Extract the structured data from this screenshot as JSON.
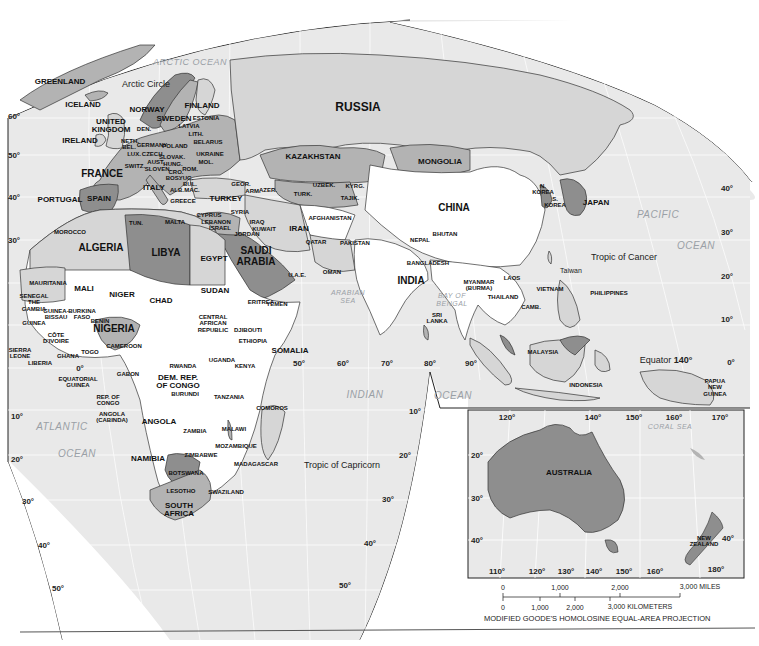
{
  "map": {
    "title": "World map - Eastern Hemisphere",
    "projection_note": "MODIFIED GOODE'S HOMOLOSINE EQUAL-AREA PROJECTION",
    "colors": {
      "ocean": "#e9e9e9",
      "land_light": "#d6d6d6",
      "land_mid": "#b3b3b3",
      "land_dark": "#8e8e8e",
      "land_white": "#ffffff",
      "border": "#333333",
      "graticule": "#ffffff",
      "ocean_label": "#9aa0a6"
    },
    "oceans": {
      "arctic": "ARCTIC OCEAN",
      "atlantic_1": "ATLANTIC",
      "atlantic_2": "OCEAN",
      "indian_1": "INDIAN",
      "indian_2": "OCEAN",
      "pacific_1": "PACIFIC",
      "pacific_2": "OCEAN",
      "arabian_sea": "ARABIAN\nSEA",
      "bay_of_bengal": "BAY OF\nBENGAL",
      "coral_sea": "CORAL SEA"
    },
    "reference_lines": {
      "arctic_circle": "Arctic Circle",
      "tropic_cancer": "Tropic of Cancer",
      "tropic_capricorn": "Tropic of Capricorn",
      "equator": "Equator",
      "equator_lon": "140°"
    },
    "countries": {
      "greenland": "GREENLAND",
      "iceland": "ICELAND",
      "norway": "NORWAY",
      "sweden": "SWEDEN",
      "finland": "FINLAND",
      "estonia": "ESTONIA",
      "latvia": "LATVIA",
      "lith": "LITH.",
      "belarus": "BELARUS",
      "ukraine": "UKRAINE",
      "mol": "MOL.",
      "rom": "ROM.",
      "uk": "UNITED\nKINGDOM",
      "ireland": "IRELAND",
      "den": "DEN.",
      "neth": "NETH.",
      "bel": "BEL.",
      "germany": "GERMANY",
      "poland": "POLAND",
      "lux": "LUX.",
      "czech": "CZECH.",
      "slovak": "SLOVAK.",
      "aust": "AUST.",
      "hung": "HUNG.",
      "switz": "SWITZ.",
      "slov": "SLOVEN.",
      "cro": "CRO.",
      "bos": "BOS.",
      "yug": "YUG.",
      "bul": "BUL.",
      "alb": "ALB.",
      "mac": "MAC.",
      "france": "FRANCE",
      "italy": "ITALY",
      "greece": "GREECE",
      "portugal": "PORTUGAL",
      "spain": "SPAIN",
      "malta": "MALTA",
      "turkey": "TURKEY",
      "cyprus": "CYPRUS",
      "lebanon": "LEBANON",
      "israel": "ISRAEL",
      "syria": "SYRIA",
      "jordan": "JORDAN",
      "iraq": "IRAQ",
      "kuwait": "KUWAIT",
      "georgia": "GEOR.",
      "armenia": "ARM.",
      "azer": "AZER.",
      "russia": "RUSSIA",
      "kazakhstan": "KAZAKHSTAN",
      "mongolia": "MONGOLIA",
      "uzbek": "UZBEK.",
      "turk": "TURK.",
      "kyrg": "KYRG.",
      "tajik": "TAJIK.",
      "afghanistan": "AFGHANISTAN",
      "iran": "IRAN",
      "pakistan": "PAKISTAN",
      "qatar": "QATAR",
      "uae": "U.A.E.",
      "oman": "OMAN",
      "yemen": "YEMEN",
      "saudi": "SAUDI\nARABIA",
      "china": "CHINA",
      "nkorea": "N.\nKOREA",
      "skorea": "S.\nKOREA",
      "japan": "JAPAN",
      "taiwan": "Taiwan",
      "nepal": "NEPAL",
      "bhutan": "BHUTAN",
      "bangladesh": "BANGLADESH",
      "india": "INDIA",
      "srilanka": "SRI\nLANKA",
      "myanmar": "MYANMAR\n(BURMA)",
      "laos": "LAOS",
      "thailand": "THAILAND",
      "vietnam": "VIETNAM",
      "camb": "CAMB.",
      "philippines": "PHILIPPINES",
      "malaysia": "MALAYSIA",
      "indonesia": "INDONESIA",
      "png": "PAPUA\nNEW\nGUINEA",
      "morocco": "MOROCCO",
      "tun": "TUN.",
      "algeria": "ALGERIA",
      "libya": "LIBYA",
      "egypt": "EGYPT",
      "mauritania": "MAURITANIA",
      "mali": "MALI",
      "niger": "NIGER",
      "chad": "CHAD",
      "sudan": "SUDAN",
      "eritrea": "ERITREA",
      "djibouti": "DJIBOUTI",
      "ethiopia": "ETHIOPIA",
      "somalia": "SOMALIA",
      "senegal": "SENEGAL\nTHE\nGAMBIA",
      "guineabissau": "GUINEA-\nBISSAU",
      "guinea": "GUINEA",
      "burkina": "BURKINA\nFASO",
      "benin": "BENIN",
      "nigeria": "NIGERIA",
      "sierraleone": "SIERRA\nLEONE",
      "liberia": "LIBERIA",
      "cotedivoire": "CÔTE\nD'IVOIRE",
      "ghana": "GHANA",
      "togo": "TOGO",
      "cameroon": "CAMEROON",
      "car": "CENTRAL\nAFRICAN\nREPUBLIC",
      "eqguinea": "EQUATORIAL\nGUINEA",
      "gabon": "GABON",
      "repcongo": "REP. OF\nCONGO",
      "cabinda": "ANGOLA\n(CABINDA)",
      "drc": "DEM. REP.\nOF CONGO",
      "uganda": "UGANDA",
      "kenya": "KENYA",
      "rwanda": "RWANDA",
      "burundi": "BURUNDI",
      "tanzania": "TANZANIA",
      "comoros": "COMOROS",
      "angola": "ANGOLA",
      "zambia": "ZAMBIA",
      "malawi": "MALAWI",
      "mozambique": "MOZAMBIQUE",
      "zimbabwe": "ZIMBABWE",
      "namibia": "NAMIBIA",
      "botswana": "BOTSWANA",
      "madagascar": "MADAGASCAR",
      "lesotho": "LESOTHO",
      "swaziland": "SWAZILAND",
      "southafrica": "SOUTH\nAFRICA",
      "australia": "AUSTRALIA",
      "newzealand": "NEW\nZEALAND"
    },
    "degree_labels": {
      "lat_left": [
        "60°",
        "50°",
        "40°",
        "30°",
        "0°",
        "10°",
        "20°",
        "30°",
        "40°",
        "50°"
      ],
      "lat_right": [
        "40°",
        "30°",
        "20°",
        "10°",
        "0°"
      ],
      "lon_indian": [
        "50°",
        "60°",
        "70°",
        "80°",
        "90°"
      ],
      "lat_indian": [
        "10°",
        "20°",
        "30°",
        "40°",
        "50°"
      ],
      "inset_top": [
        "120°",
        "140°",
        "150°",
        "160°",
        "170°"
      ],
      "inset_bottom": [
        "110°",
        "120°",
        "130°",
        "140°",
        "150°",
        "160°",
        "180°"
      ],
      "inset_left": [
        "20°",
        "30°",
        "40°"
      ],
      "inset_right": "40°"
    },
    "scale": {
      "miles": [
        "0",
        "1,000",
        "2,000",
        "3,000 MILES"
      ],
      "km": [
        "0",
        "1,000",
        "2,000",
        "3,000 KILOMETERS"
      ]
    }
  }
}
